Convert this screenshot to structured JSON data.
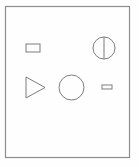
{
  "canvas": {
    "width": 139,
    "height": 167,
    "background_color": "#fefefe",
    "title": "Shapes Diagram"
  },
  "frame": {
    "name": "outer-border-frame",
    "x": 5.5,
    "y": 6.5,
    "width": 124,
    "height": 151,
    "stroke_color": "#8d8d8d",
    "stroke_width": 1.2,
    "fill": "none"
  },
  "shapes": [
    {
      "id": "small-rectangle-top-left",
      "kind": "rectangle",
      "label": "Small Rectangle",
      "x": 26,
      "y": 44,
      "width": 14,
      "height": 8,
      "stroke_color": "#7d7d7d",
      "stroke_width": 1,
      "fill": "none"
    },
    {
      "id": "bisected-circle-top-right",
      "kind": "circle-with-vertical-diameter",
      "label": "Bisected Circle",
      "cx": 104,
      "cy": 48,
      "r": 11,
      "divider_x": 104,
      "divider_y1": 37,
      "divider_y2": 59,
      "stroke_color": "#7d7d7d",
      "stroke_width": 1,
      "fill": "none"
    },
    {
      "id": "triangle-left",
      "kind": "triangle-right-pointing",
      "label": "Right Pointing Triangle",
      "points": "26,77 26,98 45,87.5",
      "stroke_color": "#7d7d7d",
      "stroke_width": 1,
      "fill": "none"
    },
    {
      "id": "large-circle-center",
      "kind": "circle",
      "label": "Large Circle",
      "cx": 71.5,
      "cy": 87.5,
      "r": 12.5,
      "stroke_color": "#7d7d7d",
      "stroke_width": 1,
      "fill": "none"
    },
    {
      "id": "tiny-rectangle-right",
      "kind": "rectangle",
      "label": "Tiny Rectangle",
      "x": 102,
      "y": 85,
      "width": 10,
      "height": 4,
      "stroke_color": "#7d7d7d",
      "stroke_width": 1,
      "fill": "none"
    }
  ]
}
